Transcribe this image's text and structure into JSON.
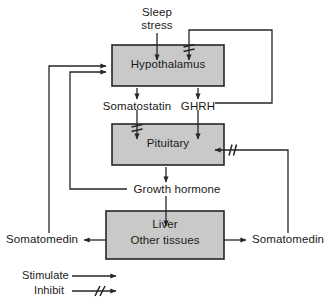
{
  "diagram": {
    "type": "flow-diagram",
    "colors": {
      "box_fill": "#c9c9c9",
      "box_stroke": "#262626",
      "line": "#262626",
      "text": "#1a1a1a",
      "background": "#ffffff"
    },
    "nodes": [
      {
        "id": "sleep-stress",
        "label_line1": "Sleep",
        "label_line2": "stress",
        "shape": "text"
      },
      {
        "id": "hypothalamus",
        "label": "Hypothalamus",
        "shape": "box"
      },
      {
        "id": "somatostatin",
        "label": "Somatostatin",
        "shape": "text"
      },
      {
        "id": "ghrh",
        "label": "GHRH",
        "shape": "text"
      },
      {
        "id": "pituitary",
        "label": "Pituitary",
        "shape": "box"
      },
      {
        "id": "growth-hormone",
        "label": "Growth hormone",
        "shape": "text"
      },
      {
        "id": "liver",
        "label_line1": "Liver",
        "label_line2": "Other tissues",
        "shape": "box"
      },
      {
        "id": "somatomedin-left",
        "label": "Somatomedin",
        "shape": "text"
      },
      {
        "id": "somatomedin-right",
        "label": "Somatomedin",
        "shape": "text"
      }
    ],
    "edges": [
      {
        "from": "sleep-stress",
        "to": "hypothalamus",
        "type": "stimulate"
      },
      {
        "from": "ghrh",
        "to": "hypothalamus",
        "type": "inhibit"
      },
      {
        "from": "hypothalamus",
        "to": "somatostatin",
        "type": "stimulate"
      },
      {
        "from": "hypothalamus",
        "to": "ghrh",
        "type": "stimulate"
      },
      {
        "from": "somatostatin",
        "to": "pituitary",
        "type": "inhibit"
      },
      {
        "from": "ghrh",
        "to": "pituitary",
        "type": "stimulate"
      },
      {
        "from": "pituitary",
        "to": "growth-hormone",
        "type": "stimulate"
      },
      {
        "from": "growth-hormone",
        "to": "hypothalamus",
        "type": "stimulate"
      },
      {
        "from": "growth-hormone",
        "to": "liver",
        "type": "stimulate"
      },
      {
        "from": "liver",
        "to": "somatomedin-left",
        "type": "stimulate"
      },
      {
        "from": "liver",
        "to": "somatomedin-right",
        "type": "stimulate"
      },
      {
        "from": "somatomedin-left",
        "to": "hypothalamus",
        "type": "stimulate"
      },
      {
        "from": "somatomedin-right",
        "to": "pituitary",
        "type": "inhibit"
      }
    ]
  },
  "legend": {
    "items": [
      {
        "label": "Stimulate",
        "marker": "plain-arrow"
      },
      {
        "label": "Inhibit",
        "marker": "double-slash-arrow"
      }
    ]
  }
}
